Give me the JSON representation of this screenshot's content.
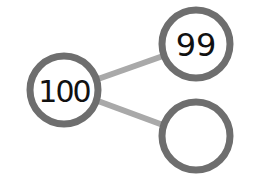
{
  "diagram": {
    "type": "number-bond",
    "colors": {
      "ring": "#6e6e6e",
      "edge": "#a9a9a9",
      "text": "#111111",
      "background": "#ffffff"
    },
    "nodes": [
      {
        "id": "whole",
        "label": "100",
        "cx": 64,
        "cy": 90,
        "r": 34
      },
      {
        "id": "part-top",
        "label": "99",
        "cx": 196,
        "cy": 44,
        "r": 34
      },
      {
        "id": "part-bottom",
        "label": "",
        "cx": 196,
        "cy": 136,
        "r": 34
      }
    ],
    "edges": [
      {
        "from": "whole",
        "to": "part-top"
      },
      {
        "from": "whole",
        "to": "part-bottom"
      }
    ]
  }
}
